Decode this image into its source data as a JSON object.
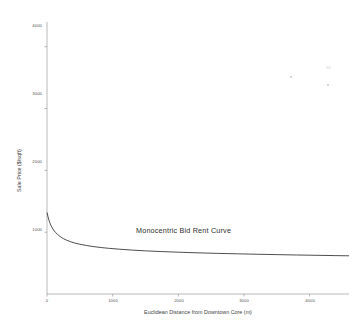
{
  "chart_data": {
    "type": "line",
    "title": "",
    "annotation": "Monocentric Bid Rent Curve",
    "xlabel": "Euclidean Distance from Downtown Core (m)",
    "ylabel": "Sale Price ($/sqft)",
    "xlim": [
      0,
      4600
    ],
    "ylim": [
      0,
      4400
    ],
    "xticks": [
      0,
      1000,
      2000,
      3000,
      4000
    ],
    "xtick_labels": [
      "0",
      "1000",
      "2000",
      "3000",
      "4000"
    ],
    "yticks": [
      1000,
      2000,
      3000,
      4000
    ],
    "ytick_labels": [
      "1000",
      "2000",
      "3000",
      "4000"
    ],
    "grid": false,
    "series": [
      {
        "name": "bid-rent-curve",
        "color": "#3a3a3a",
        "x": [
          0,
          20,
          40,
          60,
          80,
          100,
          130,
          160,
          200,
          250,
          300,
          360,
          430,
          500,
          600,
          700,
          820,
          950,
          1100,
          1300,
          1500,
          1750,
          2000,
          2300,
          2600,
          2900,
          3200,
          3500,
          3800,
          4100,
          4400,
          4600
        ],
        "y": [
          1320,
          1230,
          1160,
          1110,
          1070,
          1035,
          995,
          965,
          930,
          895,
          870,
          845,
          822,
          805,
          785,
          768,
          752,
          738,
          725,
          710,
          698,
          686,
          676,
          666,
          657,
          650,
          643,
          637,
          631,
          626,
          621,
          618
        ]
      }
    ]
  }
}
